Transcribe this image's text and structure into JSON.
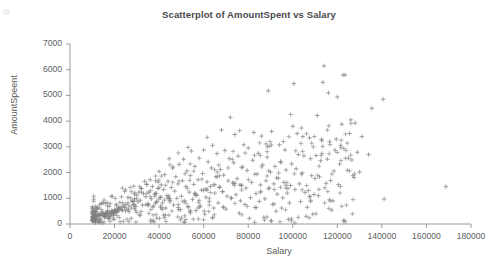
{
  "chart_data": {
    "type": "scatter",
    "title": "Scatterplot of AmountSpent vs Salary",
    "xlabel": "Salary",
    "ylabel": "AmountSpeent",
    "xlim": [
      0,
      180000
    ],
    "ylim": [
      0,
      7000
    ],
    "xticks": [
      0,
      20000,
      40000,
      60000,
      80000,
      100000,
      120000,
      140000,
      160000,
      180000
    ],
    "yticks": [
      0,
      1000,
      2000,
      3000,
      4000,
      5000,
      6000,
      7000
    ],
    "xtick_labels": [
      "0",
      "20000",
      "40000",
      "60000",
      "80000",
      "100000",
      "120000",
      "140000",
      "160000",
      "180000"
    ],
    "ytick_labels": [
      "0",
      "1000",
      "2000",
      "3000",
      "4000",
      "5000",
      "6000",
      "7000"
    ],
    "grid": false,
    "legend": false,
    "marker": "plus",
    "marker_color": "#808080",
    "n_points": 620,
    "series": [
      {
        "name": "AmountSpent vs Salary",
        "points": [
          [
            168700,
            1450
          ],
          [
            141000,
            970
          ],
          [
            140500,
            4850
          ],
          [
            135500,
            4500
          ],
          [
            134000,
            2700
          ],
          [
            131000,
            3400
          ],
          [
            130000,
            2020
          ],
          [
            129000,
            2790
          ],
          [
            128000,
            3930
          ],
          [
            127500,
            1810
          ],
          [
            127000,
            1880
          ],
          [
            126500,
            2490
          ],
          [
            126000,
            4050
          ],
          [
            125500,
            3520
          ],
          [
            125000,
            2560
          ],
          [
            124500,
            2090
          ],
          [
            123500,
            5800
          ],
          [
            122500,
            5790
          ],
          [
            122000,
            3880
          ],
          [
            121500,
            3060
          ],
          [
            121000,
            2330
          ],
          [
            120500,
            1530
          ],
          [
            120000,
            4940
          ],
          [
            119500,
            3300
          ],
          [
            119000,
            2870
          ],
          [
            118500,
            2060
          ],
          [
            118000,
            900
          ],
          [
            117500,
            540
          ],
          [
            117000,
            1690
          ],
          [
            116500,
            3200
          ],
          [
            116000,
            5100
          ],
          [
            115500,
            2520
          ],
          [
            115000,
            1580
          ],
          [
            114000,
            6150
          ],
          [
            113500,
            5510
          ],
          [
            113000,
            3240
          ],
          [
            112500,
            2460
          ],
          [
            112000,
            1830
          ],
          [
            111500,
            1100
          ],
          [
            111000,
            4220
          ],
          [
            110500,
            2660
          ],
          [
            110000,
            1770
          ],
          [
            109500,
            1150
          ],
          [
            109000,
            380
          ],
          [
            108500,
            1880
          ],
          [
            108000,
            2540
          ],
          [
            107500,
            3350
          ],
          [
            107000,
            1300
          ],
          [
            106500,
            650
          ],
          [
            106000,
            300
          ],
          [
            105500,
            1230
          ],
          [
            105000,
            2650
          ],
          [
            104500,
            3400
          ],
          [
            104000,
            1940
          ],
          [
            103500,
            870
          ],
          [
            103000,
            1560
          ],
          [
            102500,
            2700
          ],
          [
            102000,
            3520
          ],
          [
            101500,
            2150
          ],
          [
            101000,
            1340
          ],
          [
            100500,
            5460
          ],
          [
            100000,
            3800
          ],
          [
            99500,
            2340
          ],
          [
            99000,
            1500
          ],
          [
            98500,
            820
          ],
          [
            98000,
            180
          ],
          [
            97500,
            1200
          ],
          [
            97000,
            2100
          ],
          [
            96500,
            2880
          ],
          [
            96000,
            1620
          ],
          [
            95500,
            1020
          ],
          [
            95000,
            620
          ],
          [
            94500,
            2430
          ],
          [
            94000,
            3080
          ],
          [
            93500,
            1780
          ],
          [
            93000,
            1160
          ],
          [
            92500,
            500
          ],
          [
            92000,
            2240
          ],
          [
            91500,
            1560
          ],
          [
            91000,
            760
          ],
          [
            90500,
            3600
          ],
          [
            90000,
            2020
          ],
          [
            89500,
            1400
          ],
          [
            89000,
            5180
          ],
          [
            88500,
            2600
          ],
          [
            88000,
            1680
          ],
          [
            87500,
            980
          ],
          [
            87000,
            260
          ],
          [
            86500,
            2300
          ],
          [
            86000,
            3420
          ],
          [
            85500,
            1520
          ],
          [
            85000,
            880
          ],
          [
            84500,
            2750
          ],
          [
            84000,
            1940
          ],
          [
            83500,
            1180
          ],
          [
            83000,
            640
          ],
          [
            82500,
            3560
          ],
          [
            82000,
            2480
          ],
          [
            81500,
            1620
          ],
          [
            81000,
            1020
          ],
          [
            80500,
            220
          ],
          [
            80000,
            2960
          ],
          [
            79500,
            2080
          ],
          [
            79000,
            1400
          ],
          [
            78500,
            760
          ],
          [
            78000,
            3080
          ],
          [
            77500,
            2220
          ],
          [
            77000,
            1500
          ],
          [
            76500,
            900
          ],
          [
            76000,
            420
          ],
          [
            75500,
            2640
          ],
          [
            75000,
            1760
          ],
          [
            74500,
            1140
          ],
          [
            74000,
            3480
          ],
          [
            73500,
            2380
          ],
          [
            73000,
            1600
          ],
          [
            72500,
            1000
          ],
          [
            72000,
            4150
          ],
          [
            71500,
            2540
          ],
          [
            71000,
            1680
          ],
          [
            70500,
            1080
          ],
          [
            70000,
            580
          ],
          [
            69500,
            2860
          ],
          [
            69000,
            1900
          ],
          [
            68500,
            1260
          ],
          [
            68000,
            3660
          ],
          [
            67500,
            2120
          ],
          [
            67000,
            1420
          ],
          [
            66500,
            820
          ],
          [
            66000,
            2740
          ],
          [
            65500,
            1840
          ],
          [
            65000,
            1200
          ],
          [
            64500,
            620
          ],
          [
            64000,
            3060
          ],
          [
            63500,
            2180
          ],
          [
            63000,
            1460
          ],
          [
            62500,
            880
          ],
          [
            62000,
            2420
          ],
          [
            61500,
            1640
          ],
          [
            61000,
            1040
          ],
          [
            60500,
            380
          ],
          [
            60000,
            2880
          ],
          [
            59500,
            1960
          ],
          [
            59000,
            1320
          ],
          [
            58500,
            700
          ],
          [
            58000,
            2560
          ],
          [
            57500,
            1720
          ],
          [
            57000,
            1120
          ],
          [
            56500,
            520
          ],
          [
            56000,
            2240
          ],
          [
            55500,
            1540
          ],
          [
            55000,
            960
          ],
          [
            54500,
            2840
          ],
          [
            54000,
            1880
          ],
          [
            53500,
            1240
          ],
          [
            53000,
            680
          ],
          [
            52500,
            2060
          ],
          [
            52000,
            1460
          ],
          [
            51500,
            900
          ],
          [
            51000,
            2520
          ],
          [
            50500,
            1680
          ],
          [
            50000,
            1080
          ],
          [
            49500,
            560
          ],
          [
            49000,
            2320
          ],
          [
            48500,
            1560
          ],
          [
            48000,
            1000
          ],
          [
            47500,
            1840
          ],
          [
            47000,
            1280
          ],
          [
            46500,
            740
          ],
          [
            46000,
            2180
          ],
          [
            45500,
            1420
          ],
          [
            45000,
            920
          ],
          [
            44500,
            2540
          ],
          [
            44000,
            1660
          ],
          [
            43500,
            1100
          ],
          [
            43000,
            620
          ],
          [
            42500,
            1920
          ],
          [
            42000,
            1340
          ],
          [
            41500,
            820
          ],
          [
            41000,
            1520
          ],
          [
            40500,
            1040
          ],
          [
            40000,
            2040
          ],
          [
            39500,
            1380
          ],
          [
            39000,
            880
          ],
          [
            38500,
            1680
          ],
          [
            38000,
            1160
          ],
          [
            37500,
            700
          ],
          [
            37000,
            1460
          ],
          [
            36500,
            980
          ],
          [
            36000,
            1720
          ],
          [
            35500,
            1240
          ],
          [
            35000,
            780
          ],
          [
            34500,
            1540
          ],
          [
            34000,
            1060
          ],
          [
            33500,
            1660
          ],
          [
            33000,
            1180
          ],
          [
            32500,
            740
          ],
          [
            32000,
            1380
          ],
          [
            31500,
            920
          ],
          [
            31000,
            1240
          ],
          [
            30500,
            860
          ],
          [
            30000,
            1120
          ],
          [
            29500,
            680
          ],
          [
            29000,
            980
          ],
          [
            28500,
            760
          ],
          [
            28000,
            880
          ],
          [
            27500,
            620
          ],
          [
            27000,
            1020
          ],
          [
            26500,
            700
          ],
          [
            26000,
            820
          ],
          [
            25500,
            580
          ],
          [
            25000,
            760
          ],
          [
            24500,
            640
          ],
          [
            24000,
            700
          ],
          [
            23500,
            540
          ],
          [
            23000,
            660
          ],
          [
            22500,
            580
          ],
          [
            22000,
            620
          ],
          [
            21500,
            500
          ],
          [
            21000,
            560
          ],
          [
            20500,
            480
          ],
          [
            20000,
            520
          ],
          [
            19500,
            440
          ],
          [
            19000,
            500
          ],
          [
            18500,
            420
          ],
          [
            18000,
            460
          ],
          [
            17500,
            400
          ],
          [
            17000,
            440
          ],
          [
            16500,
            380
          ],
          [
            16000,
            420
          ],
          [
            15500,
            360
          ],
          [
            15000,
            400
          ],
          [
            14500,
            340
          ],
          [
            14000,
            380
          ],
          [
            13500,
            320
          ],
          [
            13000,
            360
          ],
          [
            12500,
            300
          ],
          [
            12000,
            340
          ],
          [
            11500,
            280
          ],
          [
            11000,
            320
          ],
          [
            10500,
            260
          ],
          [
            10000,
            300
          ]
        ]
      }
    ]
  }
}
